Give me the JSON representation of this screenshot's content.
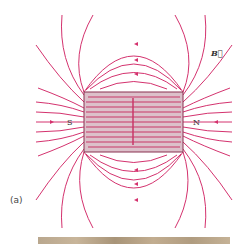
{
  "figure": {
    "caption": "(a)",
    "pole_left": "S",
    "pole_right": "N",
    "field_label": "B⃗",
    "colors": {
      "field_line": "#d4326e",
      "magnet_fill": "#d9b8c2",
      "magnet_border": "#8a3050",
      "wood": "#bca88c"
    }
  }
}
